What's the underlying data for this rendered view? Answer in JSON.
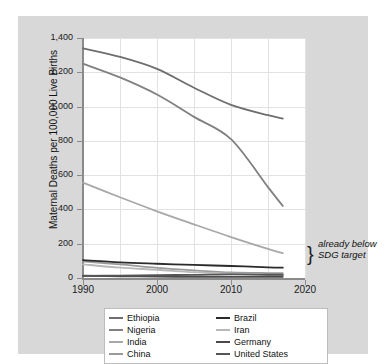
{
  "chart_data": {
    "type": "line",
    "title": "",
    "xlabel": "",
    "ylabel": "Maternal Deaths per 100,000 Live Births",
    "xlim": [
      1990,
      2020
    ],
    "ylim": [
      0,
      1400
    ],
    "xticks": [
      "1990",
      "2000",
      "2010",
      "2020"
    ],
    "yticks": [
      "0",
      "200",
      "400",
      "600",
      "800",
      "1,000",
      "1,200",
      "1,400"
    ],
    "grid": true,
    "legend_position": "bottom",
    "x": [
      1990,
      1995,
      2000,
      2005,
      2010,
      2015,
      2017
    ],
    "series": [
      {
        "name": "Ethiopia",
        "color": "#6e6e6e",
        "values": [
          1340,
          1290,
          1220,
          1110,
          1010,
          950,
          930
        ]
      },
      {
        "name": "Nigeria",
        "color": "#808080",
        "values": [
          1250,
          1170,
          1070,
          940,
          810,
          530,
          420
        ]
      },
      {
        "name": "India",
        "color": "#a8a8a8",
        "values": [
          556,
          471,
          389,
          313,
          239,
          170,
          145
        ]
      },
      {
        "name": "China",
        "color": "#9a9a9a",
        "values": [
          97,
          79,
          59,
          44,
          32,
          29,
          29
        ]
      },
      {
        "name": "Brazil",
        "color": "#2b2b2b",
        "values": [
          104,
          91,
          83,
          76,
          70,
          62,
          60
        ]
      },
      {
        "name": "Iran",
        "color": "#b8b8b8",
        "values": [
          80,
          60,
          48,
          34,
          26,
          17,
          16
        ]
      },
      {
        "name": "Germany",
        "color": "#4a4a4a",
        "values": [
          13,
          10,
          8,
          7,
          7,
          7,
          7
        ]
      },
      {
        "name": "United States",
        "color": "#555555",
        "values": [
          12,
          14,
          17,
          18,
          21,
          19,
          19
        ]
      }
    ],
    "annotation": {
      "line1": "already below",
      "line2": "SDG target",
      "brace": "}"
    }
  },
  "legend": {
    "column1": [
      "Ethiopia",
      "Nigeria",
      "India",
      "China"
    ],
    "column2": [
      "Brazil",
      "Iran",
      "Germany",
      "United States"
    ]
  },
  "colors": {
    "panel": "#d8d8d8",
    "plot_background": "#ffffff",
    "gridline": "#e2e2e2",
    "axis": "#8a8a8a"
  }
}
